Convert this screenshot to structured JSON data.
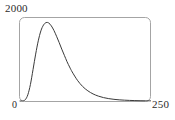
{
  "chart_data": {
    "type": "line",
    "title": "",
    "subtitle": "",
    "xlabel": "",
    "ylabel": "",
    "grid": false,
    "legend": false,
    "legend_position": "none",
    "frame": "rounded-rectangle",
    "xlim": [
      0,
      250
    ],
    "ylim": [
      0,
      2000
    ],
    "xticks": [
      0,
      250
    ],
    "xtick_labels": [
      "0",
      "250"
    ],
    "yticks": [
      0,
      2000
    ],
    "ytick_labels": [
      "0",
      "2000"
    ],
    "series": [
      {
        "name": "distribution",
        "color": "#3a3a3a",
        "x": [
          0,
          5,
          10,
          15,
          20,
          25,
          30,
          35,
          40,
          45,
          50,
          55,
          60,
          65,
          70,
          75,
          80,
          85,
          90,
          95,
          100,
          110,
          120,
          130,
          140,
          150,
          160,
          170,
          180,
          190,
          200,
          210,
          220,
          230,
          240,
          250
        ],
        "y": [
          0,
          2,
          30,
          150,
          400,
          760,
          1130,
          1450,
          1690,
          1830,
          1890,
          1880,
          1810,
          1700,
          1560,
          1410,
          1250,
          1100,
          950,
          820,
          700,
          500,
          350,
          245,
          170,
          118,
          82,
          57,
          40,
          28,
          20,
          14,
          10,
          7,
          5,
          4
        ]
      }
    ]
  },
  "labels": {
    "y_max": "2000",
    "origin": "0",
    "x_max": "250"
  },
  "colors": {
    "curve": "#3a3a3a",
    "frame": "#9a9a9a",
    "text": "#2b2b2b",
    "background": "#ffffff"
  }
}
